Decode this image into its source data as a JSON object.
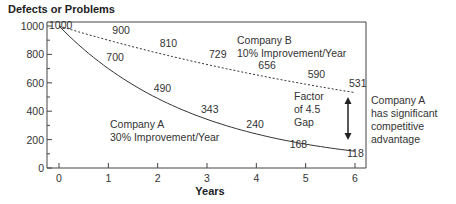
{
  "chart_data": {
    "type": "line",
    "title": "Defects or Problems",
    "xlabel": "Years",
    "ylabel": "",
    "xlim": [
      0,
      6
    ],
    "ylim": [
      0,
      1000
    ],
    "x": [
      0,
      1,
      2,
      3,
      4,
      5,
      6
    ],
    "x_ticks": [
      "0",
      "1",
      "2",
      "3",
      "4",
      "5",
      "6"
    ],
    "y_ticks": [
      "0",
      "200",
      "400",
      "600",
      "800",
      "1000"
    ],
    "y_tick_values": [
      0,
      200,
      400,
      600,
      800,
      1000
    ],
    "grid": false,
    "series": [
      {
        "name": "Company B",
        "style": "dashed",
        "values": [
          1000,
          900,
          810,
          729,
          656,
          590,
          531
        ],
        "labels": [
          "1000",
          "900",
          "810",
          "729",
          "656",
          "590",
          "531"
        ]
      },
      {
        "name": "Company A",
        "style": "solid",
        "values": [
          1000,
          700,
          490,
          343,
          240,
          168,
          118
        ],
        "labels": [
          "",
          "700",
          "490",
          "343",
          "240",
          "168",
          "118"
        ]
      }
    ],
    "annotations": {
      "company_b": [
        "Company B",
        "10% Improvement/Year"
      ],
      "company_a": [
        "Company A",
        "30% Improvement/Year"
      ],
      "gap": [
        "Factor",
        "of 4.5",
        "Gap"
      ],
      "advantage": [
        "Company A",
        "has significant",
        "competitive",
        "advantage"
      ]
    }
  }
}
